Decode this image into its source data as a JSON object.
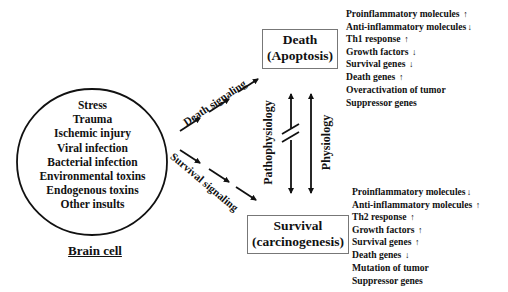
{
  "brain_cell": {
    "insults": [
      "Stress",
      "Trauma",
      "Ischemic injury",
      "Viral infection",
      "Bacterial infection",
      "Environmental toxins",
      "Endogenous toxins",
      "Other insults"
    ],
    "label": "Brain cell"
  },
  "signals": {
    "death": "Death signaling",
    "survival": "Survival signaling"
  },
  "outcomes": {
    "death": {
      "title": "Death",
      "subtitle": "(Apoptosis)"
    },
    "survival": {
      "title": "Survival",
      "subtitle": "(carcinogenesis)"
    }
  },
  "transition_labels": {
    "pathophysiology": "Pathophysiology",
    "physiology": "Physiology"
  },
  "death_effects": [
    {
      "text": "Proinflammatory molecules",
      "arrow": "↑"
    },
    {
      "text": "Anti-inflammatory molecules",
      "arrow": "↓"
    },
    {
      "text": "Th1 response",
      "arrow": "↑"
    },
    {
      "text": "Growth factors",
      "arrow": "↓"
    },
    {
      "text": "Survival genes",
      "arrow": "↓"
    },
    {
      "text": "Death genes",
      "arrow": "↑"
    },
    {
      "text": "Overactivation of tumor",
      "arrow": ""
    },
    {
      "text": "Suppressor genes",
      "arrow": ""
    }
  ],
  "survival_effects": [
    {
      "text": "Proinflammatory molecules",
      "arrow": "↓"
    },
    {
      "text": "Anti-inflammatory molecules",
      "arrow": "↑"
    },
    {
      "text": "Th2 response",
      "arrow": "↑"
    },
    {
      "text": "Growth factors",
      "arrow": "↑"
    },
    {
      "text": "Survival genes",
      "arrow": "↑"
    },
    {
      "text": "Death genes",
      "arrow": "↓"
    },
    {
      "text": "Mutation of tumor",
      "arrow": ""
    },
    {
      "text": "Suppressor genes",
      "arrow": ""
    }
  ],
  "colors": {
    "ink": "#111111",
    "box_border": "#777777",
    "background": "#ffffff"
  }
}
